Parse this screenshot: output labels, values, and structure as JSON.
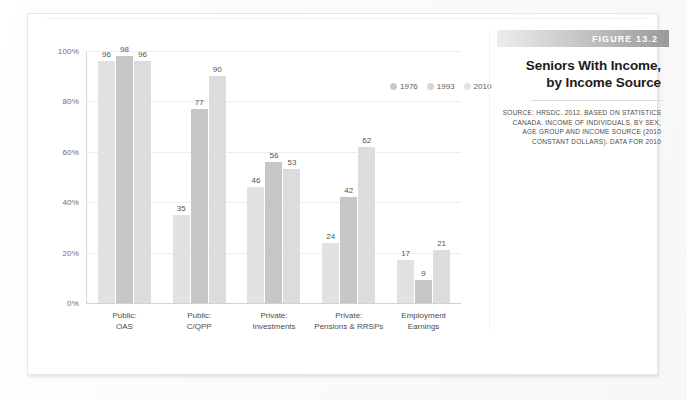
{
  "figure": {
    "badge": "FIGURE 13.2",
    "title_line1": "Seniors With Income,",
    "title_line2": "by Income Source",
    "source": "SOURCE: HRSDC. 2012. BASED ON STATISTICS CANADA. INCOME OF INDIVIDUALS, BY SEX, AGE GROUP AND INCOME SOURCE (2010 CONSTANT DOLLARS). DATA FOR 2010"
  },
  "colors": {
    "series_1976": "#e2e2e2",
    "series_1993": "#c6c6c6",
    "series_2010": "#dcdcdc",
    "gridline": "#ededed",
    "axis": "#d2d2d2",
    "badge_text": "#ffffff"
  },
  "chart_data": {
    "type": "bar",
    "title": "Seniors With Income, by Income Source",
    "xlabel": "",
    "ylabel": "",
    "ylim": [
      0,
      100
    ],
    "grid": true,
    "legend_position": "top-right",
    "ytick_labels": [
      "100%",
      "80%",
      "60%",
      "40%",
      "20%",
      "0%"
    ],
    "ytick_values": [
      100,
      80,
      60,
      40,
      20,
      0
    ],
    "categories": [
      "Public:\nOAS",
      "Public:\nC/QPP",
      "Private:\nInvestments",
      "Private:\nPensions & RRSPs",
      "Employment\nEarnings"
    ],
    "category_lines": [
      [
        "Public:",
        "OAS"
      ],
      [
        "Public:",
        "C/QPP"
      ],
      [
        "Private:",
        "Investments"
      ],
      [
        "Private:",
        "Pensions & RRSPs"
      ],
      [
        "Employment",
        "Earnings"
      ]
    ],
    "series": [
      {
        "name": "1976",
        "values": [
          96,
          35,
          46,
          24,
          17
        ]
      },
      {
        "name": "1993",
        "values": [
          98,
          77,
          56,
          42,
          9
        ]
      },
      {
        "name": "2010",
        "values": [
          96,
          90,
          53,
          62,
          21
        ]
      }
    ]
  }
}
